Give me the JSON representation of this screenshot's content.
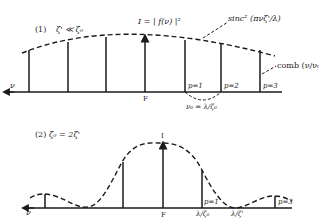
{
  "panel1": {
    "label": "(1)",
    "condition": "ζ' ≪ ζ₀",
    "intensity_label": "I = | f(ν) |²",
    "envelope_label": "sinc² (πνζ'/λ)",
    "comb_label": "comb (ν/ν₀)",
    "axis_label": "ν",
    "focus_label": "F",
    "orders": [
      "p=1",
      "p=2",
      "p=3"
    ],
    "spacing_label": "ν₀ = λ/ζ₀"
  },
  "panel2": {
    "label": "(2)",
    "condition": "ζ₀ = 2ζ'",
    "intensity_label": "I",
    "axis_label": "ν",
    "focus_label": "F",
    "orders": [
      "p=1",
      "p=3"
    ],
    "tick1_label": "λ/ζ₀",
    "tick2_label": "λ/ζ'"
  },
  "colors": {
    "ink": "#1a1a1a",
    "background": "#ffffff"
  }
}
